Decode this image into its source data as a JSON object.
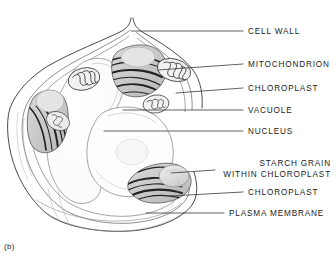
{
  "figure": {
    "caption": "(b)",
    "kind": "plant-cell-electron-micrograph-drawing",
    "width": 336,
    "height": 261,
    "background_color": "#ffffff",
    "ink_color": "#3c3c3c",
    "text_color": "#1b1b1b"
  },
  "labels": [
    {
      "id": "cell-wall",
      "text": "CELL WALL",
      "text_x": 248,
      "text_y": 27,
      "align": "left",
      "leader": {
        "x1": 131,
        "y1": 31,
        "x2": 243,
        "y2": 31
      }
    },
    {
      "id": "mitochondrion",
      "text": "MITOCHONDRION",
      "text_x": 248,
      "text_y": 60,
      "align": "left",
      "leader": {
        "x1": 158,
        "y1": 70,
        "x2": 243,
        "y2": 64
      }
    },
    {
      "id": "chloroplast-upper",
      "text": "CHLOROPLAST",
      "text_x": 248,
      "text_y": 84,
      "align": "left",
      "leader": {
        "x1": 176,
        "y1": 93,
        "x2": 243,
        "y2": 88
      }
    },
    {
      "id": "vacuole",
      "text": "VACUOLE",
      "text_x": 248,
      "text_y": 106,
      "align": "left",
      "leader": {
        "x1": 123,
        "y1": 110,
        "x2": 243,
        "y2": 110
      }
    },
    {
      "id": "nucleus",
      "text": "NUCLEUS",
      "text_x": 248,
      "text_y": 127,
      "align": "left",
      "leader": {
        "x1": 104,
        "y1": 131,
        "x2": 243,
        "y2": 131
      }
    },
    {
      "id": "starch-grain-within-chloroplast",
      "text_line1": "STARCH GRAIN",
      "text_line2": "WITHIN CHLOROPLAST",
      "text_right_x": 331,
      "text_y": 159,
      "align": "right",
      "leader": {
        "x1": 171,
        "y1": 173,
        "x2": 215,
        "y2": 170
      }
    },
    {
      "id": "chloroplast-lower",
      "text": "CHLOROPLAST",
      "text_x": 248,
      "text_y": 188,
      "align": "left",
      "leader": {
        "x1": 170,
        "y1": 196,
        "x2": 243,
        "y2": 192
      }
    },
    {
      "id": "plasma-membrane",
      "text": "PLASMA MEMBRANE",
      "text_x": 229,
      "text_y": 209,
      "align": "left",
      "leader": {
        "x1": 146,
        "y1": 213,
        "x2": 224,
        "y2": 213
      }
    }
  ],
  "structures": [
    {
      "id": "cell-wall-outer",
      "name": "cell wall outer boundary"
    },
    {
      "id": "cell-wall-inner",
      "name": "cell wall inner boundary"
    },
    {
      "id": "plasma-membrane-line",
      "name": "plasma membrane"
    },
    {
      "id": "vacuole-body",
      "name": "central vacuole"
    },
    {
      "id": "nucleus-body",
      "name": "nucleus"
    },
    {
      "id": "chloroplast-upper-right",
      "name": "chloroplast upper right"
    },
    {
      "id": "chloroplast-left",
      "name": "chloroplast left"
    },
    {
      "id": "chloroplast-lower-right",
      "name": "chloroplast lower right with starch grain"
    },
    {
      "id": "starch-grain-body",
      "name": "starch grain"
    },
    {
      "id": "mitochondrion-upper",
      "name": "mitochondrion upper"
    },
    {
      "id": "mitochondrion-right",
      "name": "mitochondrion right"
    },
    {
      "id": "mitochondrion-mid",
      "name": "mitochondrion middle"
    },
    {
      "id": "mitochondrion-low",
      "name": "mitochondrion lower"
    }
  ]
}
